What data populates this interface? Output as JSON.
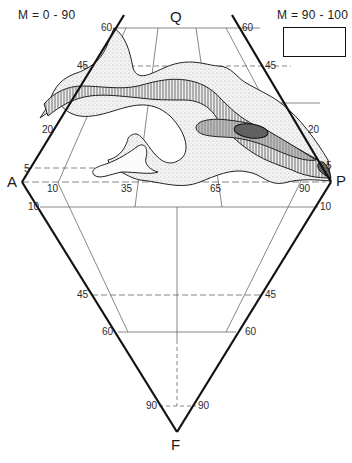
{
  "diagram": {
    "type": "QAPF double-triangle classification diagram",
    "vertices": {
      "top": "Q",
      "left": "A",
      "right": "P",
      "bottom": "F"
    },
    "legend": {
      "left_title": "M = 0 - 90",
      "right_title": "M = 90 - 100"
    },
    "upper_triangle_ticks": {
      "left_edge": [
        "60",
        "45",
        "20",
        "5"
      ],
      "right_edge": [
        "60",
        "45",
        "20",
        "5"
      ],
      "base": [
        "10",
        "35",
        "65",
        "90"
      ]
    },
    "lower_triangle_ticks": {
      "left_edge": [
        "10",
        "45",
        "60",
        "90"
      ],
      "right_edge": [
        "10",
        "45",
        "60",
        "90"
      ]
    },
    "contours": {
      "levels": [
        "outer outline",
        "stippled zone",
        "vertical-hatched zone",
        "grey zone",
        "dark core"
      ],
      "colors": {
        "stipple": "#e6e6e6",
        "hatch": "#444444",
        "grey": "#bdbdbd",
        "core": "#6e6e6e"
      }
    }
  }
}
